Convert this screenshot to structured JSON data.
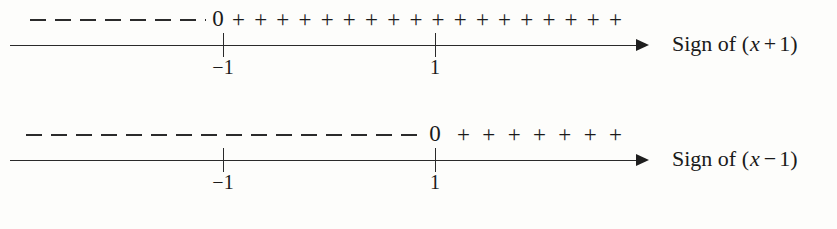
{
  "figure": {
    "type": "sign-chart",
    "axis_start_x": 10,
    "axis_end_x": 648
  },
  "lines": [
    {
      "id": "sign-of-x-plus-1",
      "caption": {
        "prefix": "Sign of (",
        "variable": "x",
        "operator": "+",
        "constant": "1",
        "suffix": ")",
        "full_text": "Sign of (x + 1)"
      },
      "ticks": [
        {
          "label": "−1",
          "value": -1,
          "x": 223
        },
        {
          "label": "1",
          "value": 1,
          "x": 435
        }
      ],
      "zero_mark": {
        "label": "0",
        "x": 218
      },
      "negative_region": {
        "from_x": 30,
        "to_x": 206,
        "symbol": "–",
        "dash_count": 8
      },
      "positive_region": {
        "from_x": 232,
        "to_x": 622,
        "symbol": "+",
        "plus_count": 18
      }
    },
    {
      "id": "sign-of-x-minus-1",
      "caption": {
        "prefix": "Sign of (",
        "variable": "x",
        "operator": "−",
        "constant": "1",
        "suffix": ")",
        "full_text": "Sign of (x − 1)"
      },
      "ticks": [
        {
          "label": "−1",
          "value": -1,
          "x": 223
        },
        {
          "label": "1",
          "value": 1,
          "x": 435
        }
      ],
      "zero_mark": {
        "label": "0",
        "x": 435
      },
      "negative_region": {
        "from_x": 26,
        "to_x": 422,
        "symbol": "–",
        "dash_count": 17
      },
      "positive_region": {
        "from_x": 457,
        "to_x": 622,
        "symbol": "+",
        "plus_count": 7
      }
    }
  ],
  "colors": {
    "ink": "#1a1a1a",
    "rule": "#2a2a2a",
    "background": "#fdfdfb"
  }
}
